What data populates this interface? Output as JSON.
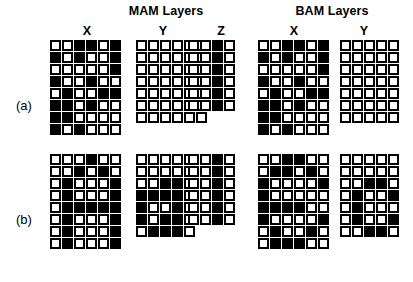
{
  "figure": {
    "groups": [
      {
        "id": "mam",
        "title": "MAM Layers"
      },
      {
        "id": "bam",
        "title": "BAM Layers"
      }
    ],
    "column_letters": [
      {
        "id": "mam-x",
        "label": "X"
      },
      {
        "id": "mam-y",
        "label": "Y"
      },
      {
        "id": "mam-z",
        "label": "Z"
      },
      {
        "id": "bam-x",
        "label": "X"
      },
      {
        "id": "bam-y",
        "label": "Y"
      }
    ],
    "row_labels": [
      {
        "id": "row-a",
        "label": "(a)"
      },
      {
        "id": "row-b",
        "label": "(b)"
      }
    ],
    "legend": {
      "filled_value": 1,
      "empty_value": 0,
      "filled_color": "#000000",
      "empty_color": "#ffffff",
      "outline_color": "#000000"
    }
  },
  "grids": {
    "a_mam_x": {
      "name": "MAM X layer, pattern (a)",
      "cols": 6,
      "rows": 8,
      "cells": [
        [
          0,
          0,
          1,
          1,
          0,
          1
        ],
        [
          1,
          0,
          1,
          0,
          0,
          1
        ],
        [
          0,
          0,
          0,
          0,
          0,
          1
        ],
        [
          1,
          0,
          0,
          1,
          0,
          0
        ],
        [
          0,
          1,
          0,
          0,
          1,
          1
        ],
        [
          1,
          1,
          0,
          1,
          0,
          0
        ],
        [
          1,
          1,
          0,
          0,
          0,
          0
        ],
        [
          1,
          0,
          1,
          0,
          0,
          0
        ]
      ]
    },
    "a_mam_y": {
      "name": "MAM Y layer, pattern (a)",
      "cols": 6,
      "rows": 7,
      "cells": [
        [
          0,
          0,
          0,
          0,
          0,
          0
        ],
        [
          0,
          0,
          0,
          0,
          0,
          0
        ],
        [
          0,
          0,
          0,
          0,
          0,
          0
        ],
        [
          0,
          0,
          0,
          0,
          0,
          0
        ],
        [
          0,
          0,
          0,
          0,
          0,
          0
        ],
        [
          0,
          0,
          0,
          0,
          0,
          0
        ],
        [
          0,
          0,
          0,
          0,
          0,
          0
        ]
      ]
    },
    "a_mam_z": {
      "name": "MAM Z layer, pattern (a)",
      "cols": 4,
      "rows": 6,
      "cells": [
        [
          0,
          0,
          1,
          0
        ],
        [
          0,
          0,
          1,
          0
        ],
        [
          0,
          0,
          1,
          0
        ],
        [
          0,
          0,
          1,
          0
        ],
        [
          0,
          0,
          1,
          0
        ],
        [
          0,
          0,
          1,
          0
        ]
      ]
    },
    "a_bam_x": {
      "name": "BAM X layer, pattern (a)",
      "cols": 6,
      "rows": 8,
      "cells": [
        [
          0,
          0,
          1,
          1,
          0,
          1
        ],
        [
          1,
          0,
          1,
          0,
          0,
          1
        ],
        [
          0,
          0,
          0,
          0,
          0,
          1
        ],
        [
          1,
          0,
          0,
          1,
          0,
          0
        ],
        [
          0,
          1,
          0,
          0,
          1,
          1
        ],
        [
          1,
          1,
          0,
          1,
          0,
          0
        ],
        [
          1,
          1,
          0,
          0,
          0,
          0
        ],
        [
          1,
          0,
          1,
          0,
          0,
          0
        ]
      ]
    },
    "a_bam_y": {
      "name": "BAM Y layer, pattern (a)",
      "cols": 5,
      "rows": 7,
      "cells": [
        [
          0,
          0,
          0,
          0,
          0
        ],
        [
          0,
          0,
          0,
          0,
          0
        ],
        [
          0,
          0,
          0,
          0,
          0
        ],
        [
          0,
          0,
          0,
          0,
          0
        ],
        [
          0,
          0,
          0,
          0,
          0
        ],
        [
          0,
          0,
          0,
          0,
          0
        ],
        [
          0,
          0,
          0,
          0,
          0
        ]
      ]
    },
    "b_mam_x": {
      "name": "MAM X layer, pattern (b)",
      "cols": 6,
      "rows": 8,
      "cells": [
        [
          0,
          0,
          0,
          1,
          0,
          0
        ],
        [
          0,
          0,
          1,
          0,
          1,
          0
        ],
        [
          0,
          1,
          0,
          0,
          0,
          1
        ],
        [
          0,
          1,
          0,
          0,
          0,
          1
        ],
        [
          0,
          1,
          1,
          1,
          1,
          1
        ],
        [
          0,
          1,
          0,
          0,
          0,
          1
        ],
        [
          0,
          1,
          0,
          0,
          0,
          1
        ],
        [
          0,
          1,
          0,
          0,
          0,
          1
        ]
      ]
    },
    "b_mam_y": {
      "name": "MAM Y layer, pattern (b)",
      "cols": 5,
      "rows": 7,
      "cells": [
        [
          0,
          0,
          0,
          0,
          0
        ],
        [
          0,
          0,
          0,
          0,
          0
        ],
        [
          0,
          0,
          1,
          1,
          0
        ],
        [
          1,
          1,
          1,
          1,
          0
        ],
        [
          1,
          0,
          0,
          1,
          0
        ],
        [
          1,
          0,
          1,
          1,
          0
        ],
        [
          0,
          1,
          1,
          1,
          0
        ]
      ]
    },
    "b_mam_z": {
      "name": "MAM Z layer, pattern (b)",
      "cols": 4,
      "rows": 6,
      "cells": [
        [
          0,
          0,
          1,
          0
        ],
        [
          0,
          0,
          1,
          0
        ],
        [
          0,
          0,
          1,
          0
        ],
        [
          0,
          0,
          1,
          0
        ],
        [
          0,
          0,
          1,
          0
        ],
        [
          0,
          0,
          1,
          0
        ]
      ]
    },
    "b_bam_x": {
      "name": "BAM X layer, pattern (b)",
      "cols": 6,
      "rows": 8,
      "cells": [
        [
          0,
          0,
          1,
          1,
          0,
          0
        ],
        [
          0,
          1,
          1,
          0,
          1,
          0
        ],
        [
          1,
          0,
          0,
          0,
          0,
          1
        ],
        [
          1,
          0,
          0,
          0,
          0,
          0
        ],
        [
          1,
          1,
          1,
          1,
          0,
          0
        ],
        [
          1,
          0,
          0,
          0,
          0,
          1
        ],
        [
          0,
          1,
          0,
          0,
          1,
          0
        ],
        [
          0,
          1,
          1,
          1,
          0,
          0
        ]
      ]
    },
    "b_bam_y": {
      "name": "BAM Y layer, pattern (b)",
      "cols": 5,
      "rows": 7,
      "cells": [
        [
          0,
          0,
          0,
          0,
          0
        ],
        [
          0,
          0,
          0,
          0,
          0
        ],
        [
          0,
          0,
          1,
          1,
          0
        ],
        [
          0,
          1,
          0,
          0,
          1
        ],
        [
          0,
          1,
          0,
          0,
          0
        ],
        [
          0,
          1,
          0,
          0,
          1
        ],
        [
          0,
          0,
          1,
          1,
          0
        ]
      ]
    }
  }
}
